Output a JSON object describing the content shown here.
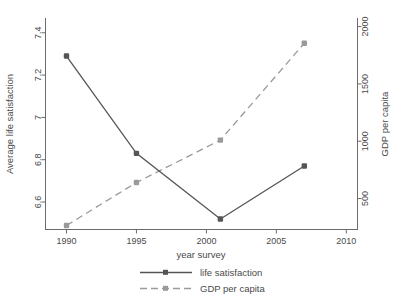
{
  "chart_data": {
    "type": "line",
    "title": "",
    "subtitle": "",
    "xlabel": "year survey",
    "ylabel": "Average life satisfaction",
    "y2label": "GDP per capita",
    "x": [
      1990,
      1995,
      2001,
      2007
    ],
    "xlim": [
      1988.5,
      2010.8
    ],
    "ylim": [
      6.47,
      7.47
    ],
    "y2lim": [
      230,
      2075
    ],
    "xticks": [
      1990,
      1995,
      2000,
      2005,
      2010
    ],
    "xticklabels": [
      "1990",
      "1995",
      "2000",
      "2005",
      "2010"
    ],
    "yticks": [
      6.6,
      6.8,
      7,
      7.2,
      7.4
    ],
    "yticklabels": [
      "6.6",
      "6.8",
      "7",
      "7.2",
      "7.4"
    ],
    "y2ticks": [
      500,
      1000,
      1500,
      2000
    ],
    "y2ticklabels": [
      "500",
      "1000",
      "1500",
      "2000"
    ],
    "grid": false,
    "legend_position": "below",
    "series": [
      {
        "name": "life satisfaction",
        "axis": "left",
        "style": "solid",
        "color": "#555555",
        "marker": "square",
        "x": [
          1990,
          1995,
          2001,
          2007
        ],
        "values": [
          7.29,
          6.83,
          6.52,
          6.77
        ]
      },
      {
        "name": "GDP per capita",
        "axis": "right",
        "style": "dashed",
        "color": "#9a9a9a",
        "marker": "square",
        "x": [
          1990,
          1995,
          2001,
          2007
        ],
        "values": [
          265,
          640,
          1010,
          1855
        ]
      }
    ]
  },
  "axes": {
    "x_title": "year survey",
    "y_left_title": "Average life satisfaction",
    "y_right_title": "GDP per capita",
    "x_tick_labels": [
      "1990",
      "1995",
      "2000",
      "2005",
      "2010"
    ],
    "y_left_tick_labels": [
      "6.6",
      "6.8",
      "7",
      "7.2",
      "7.4"
    ],
    "y_right_tick_labels": [
      "500",
      "1000",
      "1500",
      "2000"
    ]
  },
  "legend": {
    "items": [
      {
        "label": "life satisfaction",
        "color": "#555555",
        "style": "solid"
      },
      {
        "label": "GDP per capita",
        "color": "#9a9a9a",
        "style": "dashed"
      }
    ]
  }
}
